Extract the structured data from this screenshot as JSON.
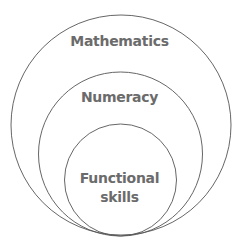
{
  "diagram": {
    "type": "nested-circles",
    "circles": [
      {
        "label": "Mathematics",
        "level": "outer"
      },
      {
        "label": "Numeracy",
        "level": "middle"
      },
      {
        "label_line1": "Functional",
        "label_line2": "skills",
        "level": "inner"
      }
    ],
    "colors": {
      "stroke": "#555555",
      "text": "#6b6b6b",
      "background": "#ffffff"
    }
  }
}
